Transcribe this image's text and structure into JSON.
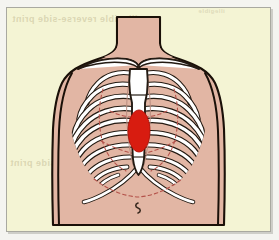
{
  "figure": {
    "view": "anterior",
    "navel_label": "navel",
    "highlight_label": "heart"
  },
  "colors": {
    "page_background": "#f4f4f0",
    "plate_background": "#f4f4d4",
    "plate_border": "#a9a9a0",
    "skin": "#e2b6a4",
    "skin_shadow": "#d8a795",
    "outline": "#1a1008",
    "bone_fill": "#ffffff",
    "bone_outline": "#231a12",
    "cartilage": "#b98d80",
    "lung_dashed": "#b4524a",
    "heart_red": "#d81c10",
    "heart_outline": "#b01208",
    "navel": "#3a2a20",
    "bleed_text": "#c4bc96"
  },
  "bleed_through_text": {
    "top_line": "illegible reverse-side print",
    "mid_line": "illegible reverse-side print",
    "corner_line": "illegible"
  },
  "anatomy": {
    "parts": [
      {
        "id": "torso",
        "label": "Torso",
        "interactable": false
      },
      {
        "id": "neck",
        "label": "Neck",
        "interactable": false
      },
      {
        "id": "clavicle",
        "label": "Clavicle",
        "interactable": false
      },
      {
        "id": "sternum",
        "label": "Sternum",
        "interactable": false
      },
      {
        "id": "ribs",
        "label": "Rib cage",
        "interactable": false
      },
      {
        "id": "costal",
        "label": "Costal margin",
        "interactable": false
      },
      {
        "id": "lungs",
        "label": "Lung outline",
        "interactable": false
      },
      {
        "id": "heart",
        "label": "Heart landmark",
        "interactable": false
      },
      {
        "id": "navel",
        "label": "Navel",
        "interactable": false
      }
    ],
    "rib_pair_count": 10,
    "heart": {
      "shape": "ellipse",
      "center_x": 140,
      "center_y": 124,
      "radius_x": 11,
      "radius_y": 21
    }
  }
}
